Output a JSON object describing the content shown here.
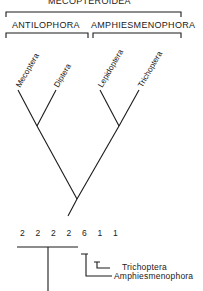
{
  "groups": {
    "super": "MECOPTEROIDEA",
    "left": "ANTILOPHORA",
    "right": "AMPHIESMENOPHORA"
  },
  "taxa": [
    "Mecoptera",
    "Diptera",
    "Lepidoptera",
    "Trichoptera"
  ],
  "character_states": "2 2 2 2 6 1 1",
  "lower_tree_labels": {
    "inner": "Trichoptera",
    "outer": "Amphiesmenophora"
  }
}
